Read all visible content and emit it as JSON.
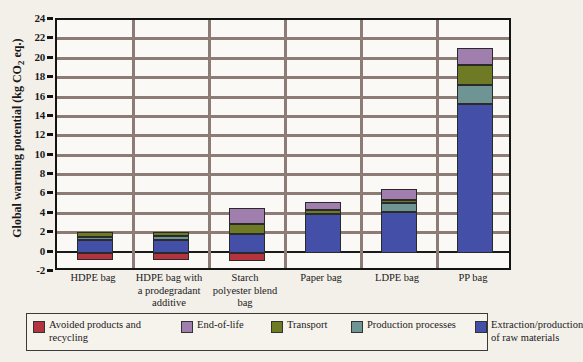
{
  "chart_data": {
    "type": "bar",
    "stacked": true,
    "title": "",
    "xlabel": "",
    "ylabel": "Global warming potential (kg CO2 eq.)",
    "ylabel_parts": {
      "pre": "Global warming potential (kg CO",
      "sub": "2",
      "post": " eq.)"
    },
    "ylim": [
      -2,
      24
    ],
    "ytick_step": 2,
    "yticks": [
      24,
      22,
      20,
      18,
      16,
      14,
      12,
      10,
      8,
      6,
      4,
      2,
      0,
      -2
    ],
    "ytick_labels": [
      "24",
      "22",
      "20",
      "18",
      "16",
      "14",
      "12",
      "10",
      "8",
      "6",
      "4",
      "2",
      "0",
      "-2"
    ],
    "grid": true,
    "grid_axis": "y",
    "legend_position": "bottom",
    "categories": [
      "HDPE bag",
      "HDPE bag with a prodegradant additive",
      "Starch polyester blend bag",
      "Paper bag",
      "LDPE bag",
      "PP bag"
    ],
    "category_label_lines": [
      [
        "HDPE bag"
      ],
      [
        "HDPE bag with",
        "a prodegradant",
        "additive"
      ],
      [
        "Starch",
        "polyester blend",
        "bag"
      ],
      [
        "Paper bag"
      ],
      [
        "LDPE bag"
      ],
      [
        "PP bag"
      ]
    ],
    "series": [
      {
        "name": "Avoided products and recycling",
        "color": "#b5333f",
        "values": [
          -0.8,
          -0.8,
          -0.9,
          0,
          0,
          0
        ]
      },
      {
        "name": "Extraction/production of raw materials",
        "color": "#4450a8",
        "values": [
          1.3,
          1.35,
          1.9,
          4.0,
          4.2,
          15.3
        ]
      },
      {
        "name": "Production processes",
        "color": "#6e9493",
        "values": [
          0.35,
          0.35,
          0.0,
          0.0,
          0.9,
          2.0
        ]
      },
      {
        "name": "Transport",
        "color": "#6e7a24",
        "values": [
          0.45,
          0.45,
          1.1,
          0.4,
          0.3,
          2.1
        ]
      },
      {
        "name": "End-of-life",
        "color": "#a07fae",
        "values": [
          0.0,
          0.0,
          1.6,
          0.8,
          1.2,
          1.7
        ]
      }
    ],
    "series_stack_order": [
      "Extraction/production of raw materials",
      "Production processes",
      "Transport",
      "End-of-life"
    ],
    "negative_series": "Avoided products and recycling",
    "bar_totals_positive": [
      2.1,
      2.15,
      4.6,
      5.2,
      6.6,
      21.1
    ],
    "legend_entries": [
      {
        "label": "Avoided products and recycling",
        "color": "#b5333f"
      },
      {
        "label": "End-of-life",
        "color": "#a07fae"
      },
      {
        "label": "Transport",
        "color": "#6e7a24"
      },
      {
        "label": "Production processes",
        "color": "#6e9493"
      },
      {
        "label": "Extraction/production of raw materials",
        "color": "#4450a8"
      }
    ],
    "legend_entry_lines": [
      [
        "Avoided products and",
        "recycling"
      ],
      [
        "End-of-life"
      ],
      [
        "Transport"
      ],
      [
        "Production processes"
      ],
      [
        "Extraction/production",
        "of raw materials"
      ]
    ]
  },
  "colors": {
    "background": "#f3efe9",
    "plot_background": "#fbf9f6",
    "axis": "#141414",
    "gridline": "#8d7b75"
  }
}
